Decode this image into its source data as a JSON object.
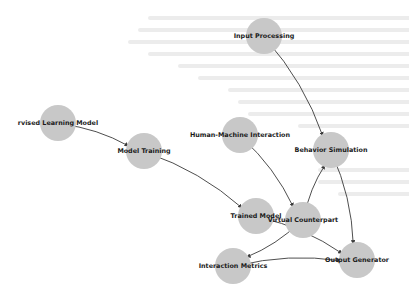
{
  "diagram": {
    "type": "directed-graph",
    "node_color": "#c8c8c8",
    "edge_color": "#3a3a3a",
    "label_color": "#1a1a1a",
    "nodes": [
      {
        "id": "supervised",
        "label": "rvised Learning Model",
        "x": 58,
        "y": 123
      },
      {
        "id": "training",
        "label": "Model Training",
        "x": 144,
        "y": 151
      },
      {
        "id": "input",
        "label": "Input Processing",
        "x": 264,
        "y": 36
      },
      {
        "id": "hmi",
        "label": "Human-Machine Interaction",
        "x": 240,
        "y": 135
      },
      {
        "id": "behavior",
        "label": "Behavior Simulation",
        "x": 331,
        "y": 150
      },
      {
        "id": "trained",
        "label": "Trained Model",
        "x": 256,
        "y": 216
      },
      {
        "id": "virtual",
        "label": "Virtual Counterpart",
        "x": 303,
        "y": 220
      },
      {
        "id": "metrics",
        "label": "Interaction Metrics",
        "x": 233,
        "y": 266
      },
      {
        "id": "output",
        "label": "Output Generator",
        "x": 357,
        "y": 260
      }
    ],
    "edges": [
      {
        "from": "supervised",
        "to": "training"
      },
      {
        "from": "training",
        "to": "trained"
      },
      {
        "from": "input",
        "to": "behavior"
      },
      {
        "from": "hmi",
        "to": "virtual"
      },
      {
        "from": "virtual",
        "to": "behavior"
      },
      {
        "from": "behavior",
        "to": "output"
      },
      {
        "from": "trained",
        "to": "output"
      },
      {
        "from": "virtual",
        "to": "metrics"
      },
      {
        "from": "metrics",
        "to": "output"
      }
    ]
  }
}
